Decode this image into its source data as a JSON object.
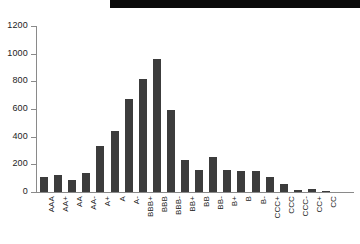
{
  "chart_data": {
    "type": "bar",
    "title": "",
    "subtitle": "",
    "xlabel": "",
    "ylabel": "",
    "categories": [
      "AAA",
      "AA+",
      "AA",
      "AA-",
      "A+",
      "A",
      "A-",
      "BBB+",
      "BBB",
      "BBB-",
      "BB+",
      "BB",
      "BB-",
      "B+",
      "B",
      "B-",
      "CCC+",
      "CCC",
      "CCC-",
      "CC+",
      "CC"
    ],
    "values": [
      110,
      120,
      85,
      140,
      330,
      440,
      670,
      815,
      965,
      595,
      235,
      160,
      250,
      160,
      155,
      150,
      105,
      60,
      15,
      20,
      10
    ],
    "ylim": [
      0,
      1200
    ],
    "yticks": [
      0,
      200,
      400,
      600,
      800,
      1000,
      1200
    ],
    "ytick_labels": [
      "0",
      "200",
      "400",
      "600",
      "800",
      "1000",
      "1200"
    ],
    "grid": false,
    "legend": null,
    "bar_color": "#3c3c3c",
    "axis_color": "#8a8a8a",
    "background": "#ffffff"
  }
}
